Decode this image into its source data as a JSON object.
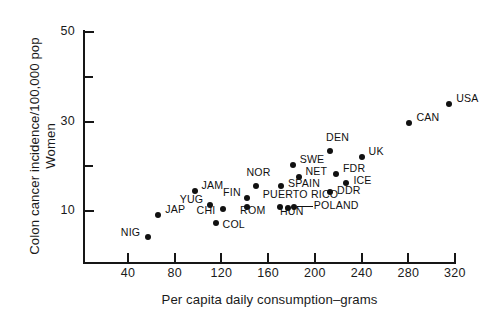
{
  "chart_data": {
    "type": "scatter",
    "title": "",
    "xlabel": "Per capita daily consumption–grams",
    "ylabel": "Colon cancer incidence/100,000 pop\nWomen",
    "xlim": [
      20,
      330
    ],
    "ylim": [
      3.5,
      52
    ],
    "xticks": [
      40,
      80,
      120,
      160,
      200,
      240,
      280,
      320
    ],
    "yticks": [
      10,
      30,
      50
    ],
    "yticks_minor": [
      20,
      40
    ],
    "grid": false,
    "legend": "none",
    "points": [
      {
        "label": "NIG",
        "x": 57,
        "y": 4.3,
        "lx": -27,
        "ly": -5
      },
      {
        "label": "JAP",
        "x": 66,
        "y": 9.0,
        "lx": 7,
        "ly": -6
      },
      {
        "label": "JAM",
        "x": 97,
        "y": 14.5,
        "lx": 7,
        "ly": -6
      },
      {
        "label": "YUG",
        "x": 110,
        "y": 11.3,
        "lx": -30,
        "ly": -6
      },
      {
        "label": "CHI",
        "x": 121,
        "y": 10.4,
        "lx": -26,
        "ly": 1
      },
      {
        "label": "COL",
        "x": 115,
        "y": 7.3,
        "lx": 7,
        "ly": 1
      },
      {
        "label": "FIN",
        "x": 142,
        "y": 13.0,
        "lx": -24,
        "ly": -6
      },
      {
        "label": "ROM",
        "x": 142,
        "y": 11.0,
        "lx": -7,
        "ly": 3
      },
      {
        "label": "NOR",
        "x": 150,
        "y": 15.5,
        "lx": -10,
        "ly": -14
      },
      {
        "label": "SPAIN",
        "x": 171,
        "y": 15.5,
        "lx": 7,
        "ly": -3
      },
      {
        "label": "SWE",
        "x": 181,
        "y": 20.2,
        "lx": 7,
        "ly": -6
      },
      {
        "label": "NET",
        "x": 186,
        "y": 17.7,
        "lx": 7,
        "ly": -6
      },
      {
        "label": "PUERTO RICO",
        "x": 170,
        "y": 11.0,
        "lx": -17,
        "ly": -13
      },
      {
        "label": "HUN",
        "x": 177,
        "y": 10.6,
        "lx": -8,
        "ly": 3
      },
      {
        "label": "POLAND",
        "x": 182,
        "y": 11.0,
        "lx": 20,
        "ly": -2
      },
      {
        "label": "DDR",
        "x": 213,
        "y": 14.3,
        "lx": 7,
        "ly": -2
      },
      {
        "label": "FDR",
        "x": 218,
        "y": 18.2,
        "lx": 7,
        "ly": -6
      },
      {
        "label": "ICE",
        "x": 227,
        "y": 16.2,
        "lx": 7,
        "ly": -3
      },
      {
        "label": "DEN",
        "x": 213,
        "y": 23.5,
        "lx": -4,
        "ly": -14
      },
      {
        "label": "UK",
        "x": 240,
        "y": 22.1,
        "lx": 7,
        "ly": -6
      },
      {
        "label": "CAN",
        "x": 281,
        "y": 29.6,
        "lx": 7,
        "ly": -6
      },
      {
        "label": "USA",
        "x": 315,
        "y": 33.9,
        "lx": 7,
        "ly": -6
      },
      {
        "label": "NZ",
        "x": 352,
        "y": 43.1,
        "lx": 7,
        "ly": -6
      }
    ]
  },
  "axes": {
    "y_title": "Colon cancer incidence/100,000 pop\nWomen",
    "x_title": "Per capita daily consumption–grams",
    "y_tick_labels": [
      "50",
      "30",
      "10"
    ],
    "x_tick_labels": [
      "40",
      "80",
      "120",
      "160",
      "200",
      "240",
      "280",
      "320"
    ]
  }
}
